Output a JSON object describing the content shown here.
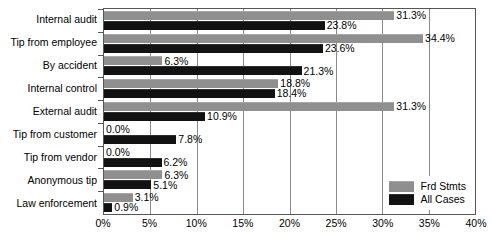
{
  "chart_data": {
    "type": "bar",
    "orientation": "horizontal",
    "title": "",
    "subtitle": "",
    "xlabel": "",
    "ylabel": "",
    "xlim": [
      0,
      40
    ],
    "xtick_labels": [
      "0%",
      "5%",
      "10%",
      "15%",
      "20%",
      "25%",
      "30%",
      "35%",
      "40%"
    ],
    "xticks": [
      0,
      5,
      10,
      15,
      20,
      25,
      30,
      35,
      40
    ],
    "grid": "vertical",
    "legend_position": "bottom-right-inside",
    "categories": [
      "Internal audit",
      "Tip from employee",
      "By accident",
      "Internal control",
      "External audit",
      "Tip from customer",
      "Tip from vendor",
      "Anonymous tip",
      "Law enforcement"
    ],
    "series": [
      {
        "name": "Frd Stmts",
        "color": "#8f8f8f",
        "values": [
          31.3,
          34.4,
          6.3,
          18.8,
          31.3,
          0.0,
          0.0,
          6.3,
          3.1
        ],
        "labels": [
          "31.3%",
          "34.4%",
          "6.3%",
          "18.8%",
          "31.3%",
          "0.0%",
          "0.0%",
          "6.3%",
          "3.1%"
        ]
      },
      {
        "name": "All Cases",
        "color": "#121212",
        "values": [
          23.8,
          23.6,
          21.3,
          18.4,
          10.9,
          7.8,
          6.2,
          5.1,
          0.9
        ],
        "labels": [
          "23.8%",
          "23.6%",
          "21.3%",
          "18.4%",
          "10.9%",
          "7.8%",
          "6.2%",
          "5.1%",
          "0.9%"
        ]
      }
    ]
  },
  "legend": {
    "items": [
      {
        "label": "Frd Stmts",
        "swatch": "gray-swatch-icon"
      },
      {
        "label": "All Cases",
        "swatch": "black-swatch-icon"
      }
    ]
  }
}
